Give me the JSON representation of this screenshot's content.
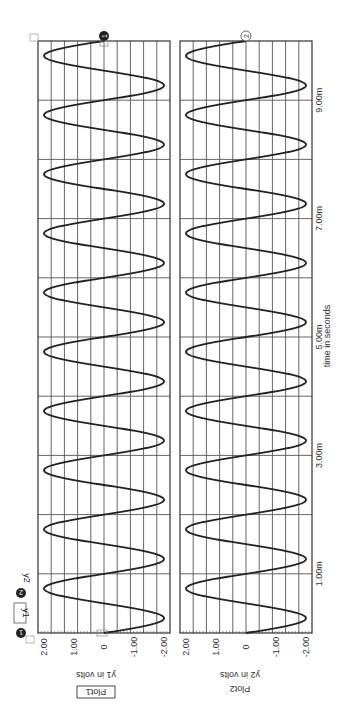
{
  "orientation": "rotated-90-clockwise",
  "legend": {
    "items": [
      {
        "marker": "1",
        "label": "y1",
        "boxed": true
      },
      {
        "marker": "2",
        "label": "y2",
        "boxed": false
      }
    ]
  },
  "x_axis": {
    "title": "time in seconds",
    "tick_labels": [
      "1.00m",
      "3.00m",
      "5.00m",
      "7.00m",
      "9.00m"
    ],
    "tick_values_ms": [
      1,
      3,
      5,
      7,
      9
    ],
    "range_ms": [
      0,
      10
    ]
  },
  "plots": [
    {
      "name": "Plot1",
      "title_boxed": true,
      "ylabel": "y1 in volts",
      "y_tick_labels": [
        "2.00",
        "1.00",
        "0",
        "-1.00",
        "-2.00"
      ],
      "cursor_marker": "1",
      "cursor_style": "filled"
    },
    {
      "name": "Plot2",
      "title_boxed": false,
      "ylabel": "y2 in volts",
      "y_tick_labels": [
        "2.00",
        "1.00",
        "0",
        "-1.00",
        "-2.00"
      ],
      "cursor_marker": "2",
      "cursor_style": "outline"
    }
  ],
  "colors": {
    "trace": "#222222",
    "grid": "#555555",
    "background": "#ffffff",
    "marker_fill": "#222222"
  },
  "chart_data": [
    {
      "type": "line",
      "title": "Plot1",
      "xlabel": "time in seconds",
      "ylabel": "y1 in volts",
      "xlim": [
        0,
        0.01
      ],
      "ylim": [
        -2.2,
        2.2
      ],
      "x_ticks": [
        "1.00m",
        "3.00m",
        "5.00m",
        "7.00m",
        "9.00m"
      ],
      "y_ticks": [
        "2.00",
        "1.00",
        "0",
        "-1.00",
        "-2.00"
      ],
      "grid": true,
      "series": [
        {
          "name": "y1",
          "waveform": "sine",
          "amplitude": 2.0,
          "frequency_hz": 1000,
          "phase_deg": 180,
          "cycles": 10,
          "x": [
            0,
            0.00025,
            0.0005,
            0.00075,
            0.001,
            0.005,
            0.01
          ],
          "values": [
            0,
            -2.0,
            0,
            2.0,
            0,
            0,
            0
          ]
        }
      ]
    },
    {
      "type": "line",
      "title": "Plot2",
      "xlabel": "time in seconds",
      "ylabel": "y2 in volts",
      "xlim": [
        0,
        0.01
      ],
      "ylim": [
        -2.2,
        2.2
      ],
      "x_ticks": [
        "1.00m",
        "3.00m",
        "5.00m",
        "7.00m",
        "9.00m"
      ],
      "y_ticks": [
        "2.00",
        "1.00",
        "0",
        "-1.00",
        "-2.00"
      ],
      "grid": true,
      "series": [
        {
          "name": "y2",
          "waveform": "sine",
          "amplitude": 2.0,
          "frequency_hz": 1000,
          "phase_deg": 180,
          "cycles": 10,
          "x": [
            0,
            0.00025,
            0.0005,
            0.00075,
            0.001,
            0.005,
            0.01
          ],
          "values": [
            0,
            -2.0,
            0,
            2.0,
            0,
            0,
            0
          ]
        }
      ]
    }
  ]
}
